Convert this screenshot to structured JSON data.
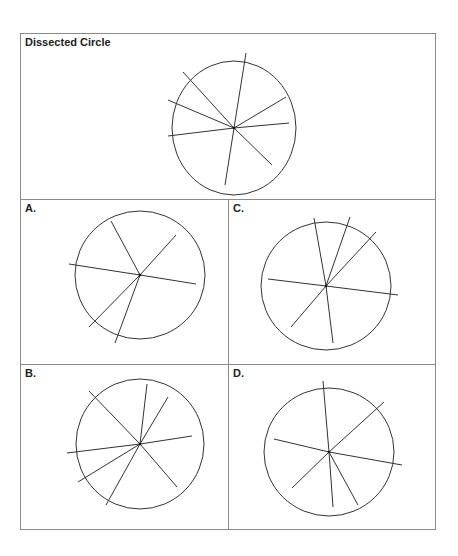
{
  "title": "Dissected Circle",
  "panels": {
    "top": {
      "label": "Dissected Circle"
    },
    "a": {
      "label": "A."
    },
    "b": {
      "label": "B."
    },
    "c": {
      "label": "C."
    },
    "d": {
      "label": "D."
    }
  },
  "colors": {
    "line": "#333333",
    "border": "#8a8a8a"
  },
  "figures": [
    {
      "id": "top",
      "cx": 234,
      "cy": 128,
      "rx": 62,
      "ry": 67,
      "ends": [
        [
          246,
          53
        ],
        [
          183,
          72
        ],
        [
          168,
          100
        ],
        [
          286,
          97
        ],
        [
          289,
          123
        ],
        [
          168,
          136
        ],
        [
          272,
          165
        ],
        [
          225,
          185
        ]
      ]
    },
    {
      "id": "a",
      "cx": 140,
      "cy": 275,
      "rx": 65,
      "ry": 64,
      "ends": [
        [
          111,
          221
        ],
        [
          176,
          235
        ],
        [
          69,
          264
        ],
        [
          196,
          284
        ],
        [
          89,
          327
        ],
        [
          115,
          343
        ]
      ]
    },
    {
      "id": "c",
      "cx": 326,
      "cy": 286,
      "rx": 65,
      "ry": 64,
      "ends": [
        [
          314,
          218
        ],
        [
          350,
          217
        ],
        [
          376,
          232
        ],
        [
          268,
          279
        ],
        [
          398,
          295
        ],
        [
          291,
          327
        ],
        [
          333,
          343
        ]
      ]
    },
    {
      "id": "b",
      "cx": 140,
      "cy": 444,
      "rx": 64,
      "ry": 65,
      "ends": [
        [
          89,
          391
        ],
        [
          147,
          384
        ],
        [
          168,
          397
        ],
        [
          192,
          436
        ],
        [
          67,
          453
        ],
        [
          78,
          482
        ],
        [
          106,
          505
        ],
        [
          177,
          487
        ]
      ]
    },
    {
      "id": "d",
      "cx": 329,
      "cy": 452,
      "rx": 65,
      "ry": 64,
      "ends": [
        [
          323,
          381
        ],
        [
          384,
          402
        ],
        [
          274,
          439
        ],
        [
          402,
          465
        ],
        [
          292,
          488
        ],
        [
          333,
          507
        ],
        [
          358,
          505
        ]
      ]
    }
  ]
}
